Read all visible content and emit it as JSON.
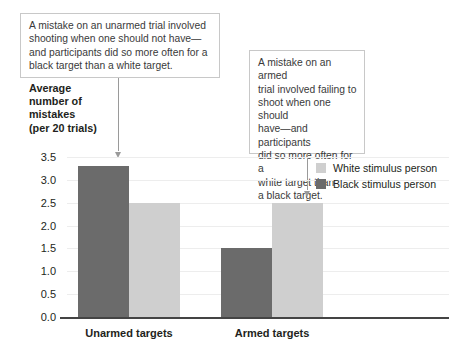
{
  "chart_data": {
    "type": "bar",
    "title": "",
    "xlabel": "",
    "ylabel": "Average\nnumber of\nmistakes\n(per 20 trials)",
    "categories": [
      "Unarmed targets",
      "Armed targets"
    ],
    "series": [
      {
        "name": "White stimulus person",
        "color": "#cfcfcf",
        "values": [
          2.5,
          2.5
        ]
      },
      {
        "name": "Black stimulus person",
        "color": "#6b6b6b",
        "values": [
          3.3,
          1.5
        ]
      }
    ],
    "ylim": [
      0.0,
      3.5
    ],
    "yticks": [
      "0.0",
      "0.5",
      "1.0",
      "1.5",
      "2.0",
      "2.5",
      "3.0",
      "3.5"
    ],
    "grid": true,
    "legend_position": "right",
    "annotations": [
      {
        "name": "unarmed-callout",
        "text": "A mistake on an unarmed trial involved\nshooting when one should not have—\nand participants did so more often for a\nblack target than a white target.",
        "points_to": "Black stimulus person bar, Unarmed targets"
      },
      {
        "name": "armed-callout",
        "text": "A mistake on an armed\ntrial involved failing to\nshoot when one should\nhave—and participants\ndid so more often for a\nwhite target than\na black target.",
        "points_to": "White stimulus person bar, Armed targets"
      }
    ]
  },
  "legend": {
    "items": [
      {
        "label": "White stimulus person"
      },
      {
        "label": "Black stimulus person"
      }
    ]
  }
}
